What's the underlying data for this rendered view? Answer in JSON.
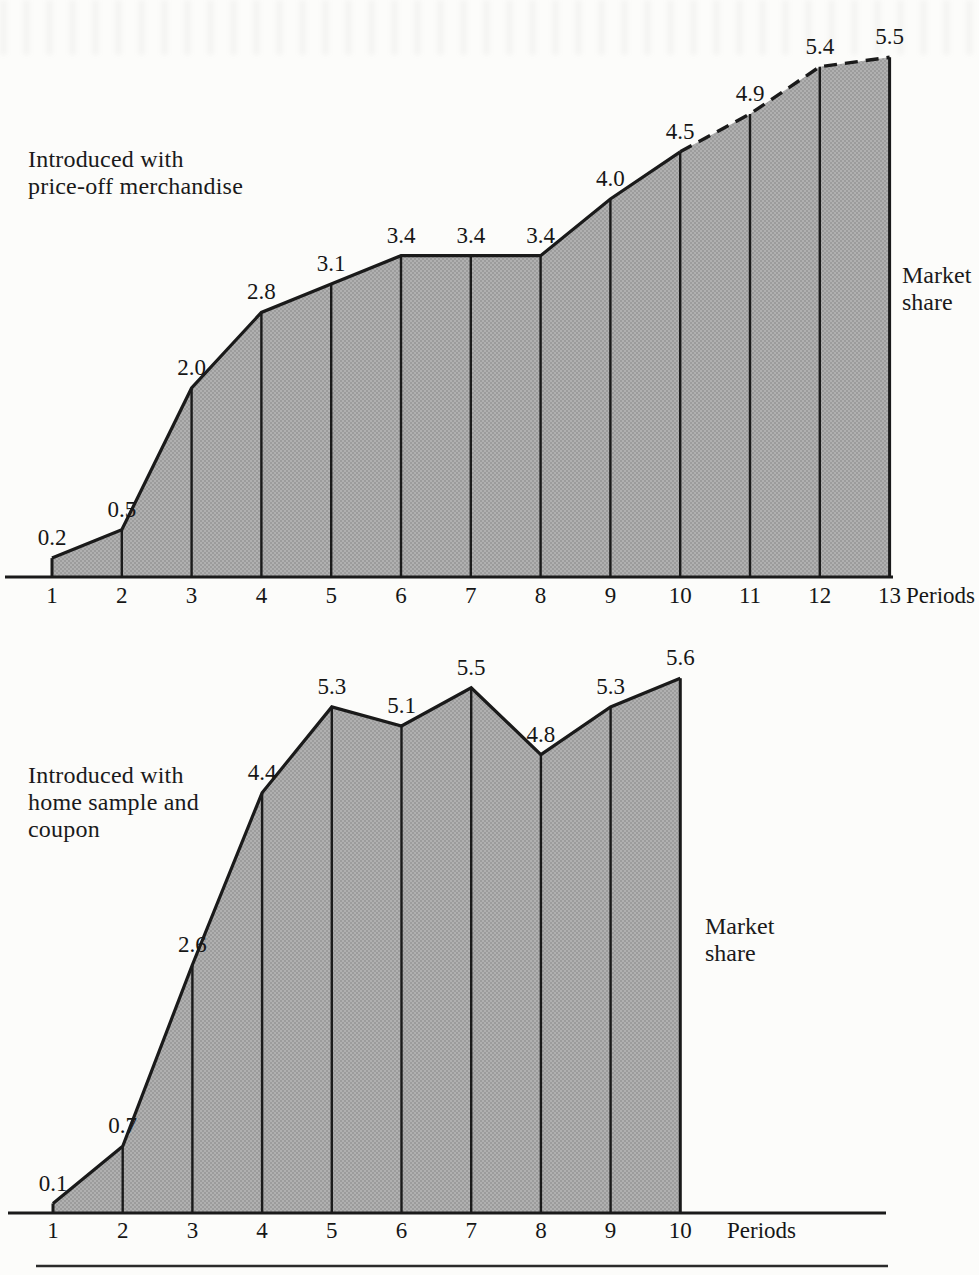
{
  "figure": {
    "background": "#fcfcfa",
    "ink": "#1a1a1a",
    "area_fill_base": "#b0b0b0",
    "area_fill_dot": "#949494"
  },
  "chart_data": [
    {
      "type": "area",
      "title": "Introduced with price-off merchandise",
      "annotation_lines": [
        "Introduced with",
        "price-off merchandise"
      ],
      "ylabel": "Market share",
      "ylabel_lines": [
        "Market",
        "share"
      ],
      "xlabel": "Periods",
      "x": [
        1,
        2,
        3,
        4,
        5,
        6,
        7,
        8,
        9,
        10,
        11,
        12,
        13
      ],
      "values": [
        0.2,
        0.5,
        2.0,
        2.8,
        3.1,
        3.4,
        3.4,
        3.4,
        4.0,
        4.5,
        4.9,
        5.4,
        5.5
      ],
      "dashed_from_period": 10,
      "ylim": [
        0,
        6
      ],
      "legend": "none",
      "grid": false
    },
    {
      "type": "area",
      "title": "Introduced with home sample and coupon",
      "annotation_lines": [
        "Introduced with",
        "home sample and",
        "coupon"
      ],
      "ylabel": "Market share",
      "ylabel_lines": [
        "Market",
        "share"
      ],
      "xlabel": "Periods",
      "x": [
        1,
        2,
        3,
        4,
        5,
        6,
        7,
        8,
        9,
        10
      ],
      "values": [
        0.1,
        0.7,
        2.6,
        4.4,
        5.3,
        5.1,
        5.5,
        4.8,
        5.3,
        5.6
      ],
      "dashed_from_period": null,
      "ylim": [
        0,
        6
      ],
      "legend": "none",
      "grid": false
    }
  ]
}
